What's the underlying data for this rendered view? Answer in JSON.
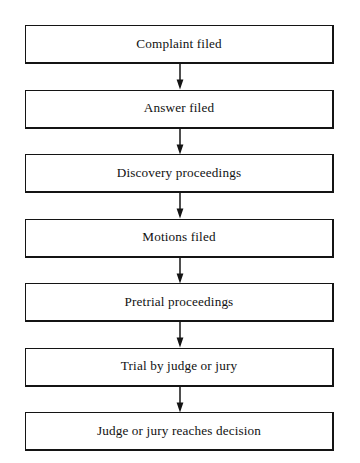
{
  "diagram": {
    "type": "flowchart",
    "orientation": "vertical",
    "box_border_color": "#141414",
    "box_fill_color": "#ffffff",
    "text_color": "#111111",
    "arrow_color": "#141414",
    "background_color": "#ffffff",
    "node_count": 7,
    "connector_count": 6,
    "nodes": [
      {
        "id": "complaint-filed",
        "label": "Complaint filed",
        "order": 1
      },
      {
        "id": "answer-filed",
        "label": "Answer filed",
        "order": 2
      },
      {
        "id": "discovery-proceedings",
        "label": "Discovery proceedings",
        "order": 3
      },
      {
        "id": "motions-filed",
        "label": "Motions filed",
        "order": 4
      },
      {
        "id": "pretrial-proceedings",
        "label": "Pretrial proceedings",
        "order": 5
      },
      {
        "id": "trial-by-judge-or-jury",
        "label": "Trial by judge or jury",
        "order": 6
      },
      {
        "id": "judge-or-jury-reaches-decision",
        "label": "Judge or jury reaches decision",
        "order": 7
      }
    ],
    "connectors": [
      {
        "from": "complaint-filed",
        "to": "answer-filed",
        "icon": "down-arrow-icon"
      },
      {
        "from": "answer-filed",
        "to": "discovery-proceedings",
        "icon": "down-arrow-icon"
      },
      {
        "from": "discovery-proceedings",
        "to": "motions-filed",
        "icon": "down-arrow-icon"
      },
      {
        "from": "motions-filed",
        "to": "pretrial-proceedings",
        "icon": "down-arrow-icon"
      },
      {
        "from": "pretrial-proceedings",
        "to": "trial-by-judge-or-jury",
        "icon": "down-arrow-icon"
      },
      {
        "from": "trial-by-judge-or-jury",
        "to": "judge-or-jury-reaches-decision",
        "icon": "down-arrow-icon"
      }
    ]
  }
}
